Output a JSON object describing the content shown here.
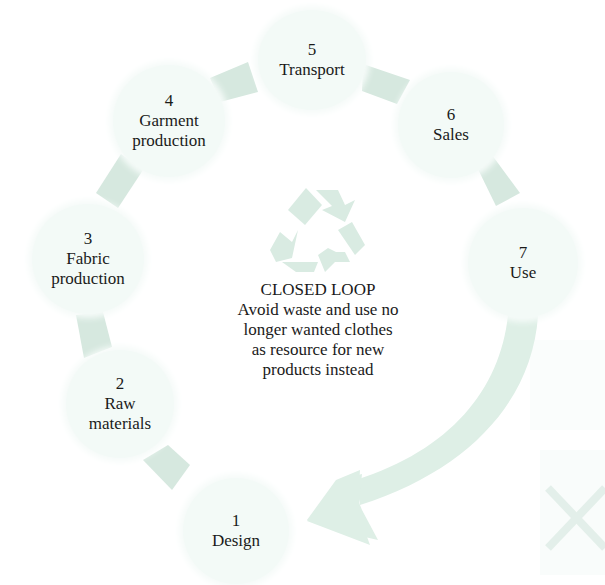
{
  "diagram": {
    "type": "closed-loop cycle",
    "colors": {
      "connector": "#d6e8df",
      "node_fill": "#f3faf7",
      "arrow": "#deefe6",
      "recycle_icon": "#d9ebe2",
      "text": "#1a1a1a"
    },
    "nodes": [
      {
        "number": "1",
        "label": "Design"
      },
      {
        "number": "2",
        "label": "Raw materials"
      },
      {
        "number": "3",
        "label": "Fabric production"
      },
      {
        "number": "4",
        "label": "Garment production"
      },
      {
        "number": "5",
        "label": "Transport"
      },
      {
        "number": "6",
        "label": "Sales"
      },
      {
        "number": "7",
        "label": "Use"
      }
    ],
    "node_labels_split": {
      "n2": [
        "Raw",
        "materials"
      ],
      "n3": [
        "Fabric",
        "production"
      ],
      "n4": [
        "Garment",
        "production"
      ]
    },
    "center": {
      "icon": "recycle-icon",
      "title": "CLOSED LOOP",
      "description_lines": [
        "Avoid waste and use no",
        "longer wanted clothes",
        "as resource for new",
        "products instead"
      ]
    },
    "return_arrow": {
      "from": "7",
      "to": "1",
      "icon": "curved-arrow-icon"
    },
    "background_decoration": {
      "icon": "faint-x-icon"
    }
  }
}
